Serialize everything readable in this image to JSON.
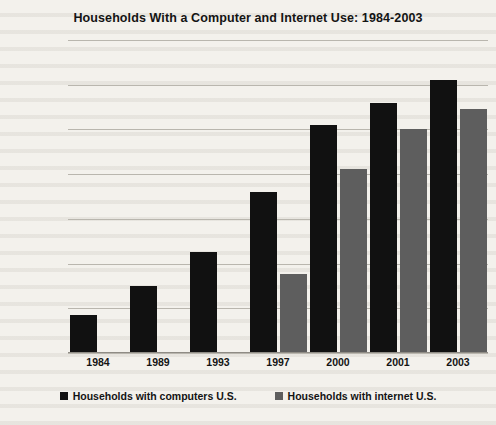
{
  "chart_data": {
    "type": "bar",
    "title": "Households With a Computer and Internet Use: 1984-2003",
    "xlabel": "",
    "ylabel": "",
    "ylim": [
      0,
      70
    ],
    "ytick_step": 10,
    "grid": true,
    "legend_position": "bottom",
    "categories": [
      "1984",
      "1989",
      "1993",
      "1997",
      "2000",
      "2001",
      "2003"
    ],
    "ytick_labels": [
      "70.0%",
      "60.0%",
      "50.0%",
      "40.0%",
      "30.0%",
      "20.0%",
      "10.0%",
      "0.0%"
    ],
    "ytick_values": [
      70,
      60,
      50,
      40,
      30,
      20,
      10,
      0
    ],
    "series": [
      {
        "name": "Households with computers U.S.",
        "color": "#111111",
        "values": [
          8.5,
          15.0,
          22.6,
          36.0,
          51.0,
          56.0,
          61.0
        ]
      },
      {
        "name": "Households with internet U.S.",
        "color": "#5e5e5e",
        "values": [
          null,
          null,
          null,
          17.7,
          41.2,
          50.1,
          54.5
        ]
      }
    ]
  },
  "colors": {
    "background": "#f3f1ec",
    "text": "#141414",
    "gridline": "#b9b6ae",
    "series_computers": "#111111",
    "series_internet": "#5e5e5e"
  }
}
